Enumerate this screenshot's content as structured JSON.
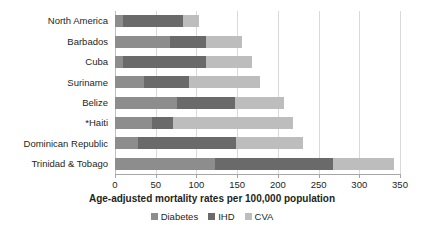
{
  "chart_data": {
    "type": "bar",
    "orientation": "horizontal",
    "stacked": true,
    "title": "",
    "xlabel": "Age-adjusted mortality rates per 100,000 population",
    "ylabel": "",
    "xlim": [
      0,
      350
    ],
    "xticks": [
      0,
      50,
      100,
      150,
      200,
      250,
      300,
      350
    ],
    "xticklabels": [
      "0",
      "50",
      "100",
      "150",
      "200",
      "250",
      "300",
      "350"
    ],
    "grid": true,
    "grid_axis": "x",
    "legend_position": "bottom",
    "categories": [
      "North America",
      "Barbados",
      "Cuba",
      "Suriname",
      "Belize",
      "*Haiti",
      "Dominican Republic",
      "Trinidad & Tobago"
    ],
    "series": [
      {
        "name": "Diabetes",
        "color": "#8d8d8d",
        "values": [
          10,
          68,
          10,
          35,
          76,
          45,
          28,
          123
        ]
      },
      {
        "name": "IHD",
        "color": "#6a6a6a",
        "values": [
          73,
          44,
          102,
          56,
          71,
          26,
          121,
          145
        ]
      },
      {
        "name": "CVA",
        "color": "#bdbdbd",
        "values": [
          20,
          44,
          56,
          87,
          60,
          148,
          82,
          75
        ]
      }
    ],
    "totals": [
      103,
      156,
      168,
      178,
      207,
      219,
      231,
      343
    ]
  },
  "legend": {
    "items": [
      {
        "label": "Diabetes",
        "color": "#8d8d8d"
      },
      {
        "label": "IHD",
        "color": "#6a6a6a"
      },
      {
        "label": "CVA",
        "color": "#bdbdbd"
      }
    ]
  }
}
